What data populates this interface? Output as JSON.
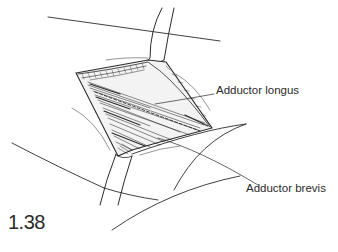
{
  "figure": {
    "number": "1.38",
    "type": "surgical anatomical illustration",
    "labels": [
      {
        "id": "adductor-longus",
        "text": "Adductor longus"
      },
      {
        "id": "adductor-brevis",
        "text": "Adductor brevis"
      }
    ]
  },
  "colors": {
    "ink": "#2a2a2a",
    "background": "#ffffff"
  }
}
